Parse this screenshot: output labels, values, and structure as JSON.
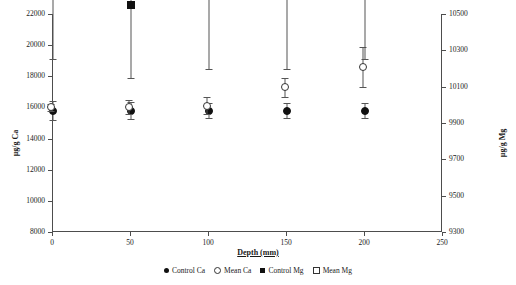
{
  "chart_data": {
    "type": "scatter",
    "title": "",
    "xlabel": "Depth (mm)",
    "ylabel": "µg/g Ca",
    "ylabel_right": "µg/g Mg",
    "grid": false,
    "legend_position": "bottom",
    "x": [
      0,
      50,
      100,
      150,
      200
    ],
    "xlim": [
      0,
      250
    ],
    "xticks": [
      "0",
      "50",
      "100",
      "150",
      "200",
      "250"
    ],
    "xtick_values": [
      0,
      50,
      100,
      150,
      200,
      250
    ],
    "ylim": [
      8000,
      22000
    ],
    "yticks": [
      "8000",
      "10000",
      "12000",
      "14000",
      "16000",
      "18000",
      "20000",
      "22000"
    ],
    "ytick_values": [
      8000,
      10000,
      12000,
      14000,
      16000,
      18000,
      20000,
      22000
    ],
    "ylim_right": [
      9300,
      10500
    ],
    "yticks_right": [
      "9300",
      "9500",
      "9700",
      "9900",
      "10100",
      "10300",
      "10500"
    ],
    "ytick_values_right": [
      9300,
      9500,
      9700,
      9900,
      10100,
      10300,
      10500
    ],
    "series": [
      {
        "name": "Control Ca",
        "marker": "circle-filled",
        "axis": "left",
        "values": [
          15800,
          15800,
          15800,
          15800,
          15800
        ],
        "err_low": [
          15200,
          15250,
          15300,
          15300,
          15300
        ],
        "err_high": [
          16400,
          16350,
          16300,
          16300,
          16300
        ]
      },
      {
        "name": "Mean Ca",
        "marker": "circle-open",
        "axis": "left",
        "values": [
          16000,
          16000,
          16100,
          17300,
          18600
        ],
        "err_low": [
          15750,
          15550,
          15550,
          16700,
          17300
        ],
        "err_high": [
          16250,
          16450,
          16650,
          17900,
          19900
        ]
      },
      {
        "name": "Control Mg",
        "marker": "square-filled",
        "axis": "right",
        "values": [
          10700,
          10550,
          10600,
          10600,
          10650
        ],
        "err_low": [
          10250,
          10150,
          10200,
          10200,
          10250
        ],
        "err_high": [
          11150,
          10950,
          11000,
          11000,
          11050
        ]
      },
      {
        "name": "Mean Mg",
        "marker": "square-open",
        "axis": "right",
        "values": [
          11000,
          11500,
          11700,
          12700,
          13300
        ],
        "err_low": [
          10800,
          10750,
          10950,
          11850,
          12450
        ],
        "err_high": [
          11950,
          12250,
          12450,
          13550,
          14150
        ]
      }
    ]
  }
}
